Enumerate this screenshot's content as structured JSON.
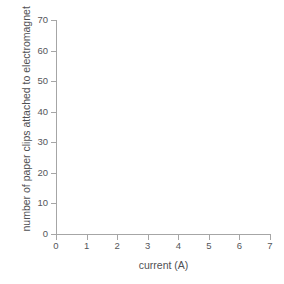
{
  "chart_data": {
    "type": "scatter",
    "title": "",
    "subtitle": "",
    "xlabel": "current (A)",
    "ylabel": "number of paper clips attached to electromagnet",
    "x": [],
    "values": [],
    "series": [],
    "annotations": [],
    "legend": [],
    "legend_position": "none",
    "grid": false,
    "xlim": [
      0,
      7
    ],
    "ylim": [
      0,
      70
    ],
    "x_ticks": [
      "0",
      "1",
      "2",
      "3",
      "4",
      "5",
      "6",
      "7"
    ],
    "x_tick_values": [
      0,
      1,
      2,
      3,
      4,
      5,
      6,
      7
    ],
    "y_ticks": [
      "70",
      "60",
      "50",
      "40",
      "30",
      "20",
      "10",
      "0"
    ],
    "y_tick_values": [
      70,
      60,
      50,
      40,
      30,
      20,
      10,
      0
    ],
    "note": "blank plotting axes, no data series drawn"
  },
  "colors": {
    "background": "#ffffff",
    "axis": "#a6a6a6",
    "tick_label": "#55565a",
    "axis_title": "#4f5053"
  }
}
